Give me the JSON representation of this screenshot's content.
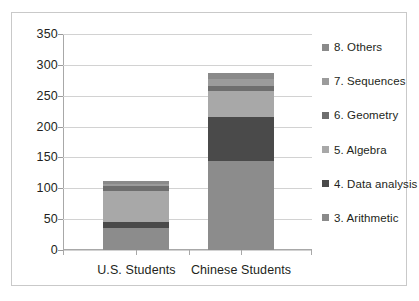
{
  "chart_data": {
    "type": "bar",
    "subtype": "stacked-bar",
    "title": "",
    "xlabel": "",
    "ylabel": "",
    "categories": [
      "U.S. Students",
      "Chinese Students"
    ],
    "ylim": [
      0,
      350
    ],
    "yticks": [
      0,
      50,
      100,
      150,
      200,
      250,
      300,
      350
    ],
    "ytick_labels": [
      "0",
      "50",
      "100",
      "150",
      "200",
      "250",
      "300",
      "350"
    ],
    "grid": true,
    "legend_position": "right",
    "series": [
      {
        "name": "3. Arithmetic",
        "color": "#8c8c8c",
        "values": [
          36,
          145
        ]
      },
      {
        "name": "4. Data analysis",
        "color": "#4a4a4a",
        "values": [
          9,
          71
        ]
      },
      {
        "name": "5. Algebra",
        "color": "#a8a8a8",
        "values": [
          51,
          41
        ]
      },
      {
        "name": "6. Geometry",
        "color": "#6e6e6e",
        "values": [
          7,
          9
        ]
      },
      {
        "name": "7. Sequences",
        "color": "#9b9b9b",
        "values": [
          4,
          11
        ]
      },
      {
        "name": "8. Others",
        "color": "#8a8a8a",
        "values": [
          5,
          10
        ]
      }
    ],
    "totals": [
      112,
      287
    ],
    "legend_entries": [
      {
        "label": "8. Others",
        "color": "#8a8a8a"
      },
      {
        "label": "7. Sequences",
        "color": "#9b9b9b"
      },
      {
        "label": "6. Geometry",
        "color": "#6e6e6e"
      },
      {
        "label": "5. Algebra",
        "color": "#a8a8a8"
      },
      {
        "label": "4. Data analysis",
        "color": "#4a4a4a"
      },
      {
        "label": "3. Arithmetic",
        "color": "#8a8a8a"
      }
    ]
  }
}
